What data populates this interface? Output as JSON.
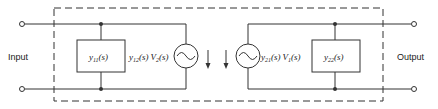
{
  "diagram": {
    "input_label": "Input",
    "output_label": "Output",
    "y11": {
      "sym": "y",
      "sub": "11",
      "arg": "(s)"
    },
    "y22": {
      "sym": "y",
      "sub": "22",
      "arg": "(s)"
    },
    "source_left": {
      "y_sym": "y",
      "y_sub": "12",
      "y_arg": "(s)",
      "v_sym": "V",
      "v_sub": "2",
      "v_arg": "(s)"
    },
    "source_right": {
      "y_sym": "y",
      "y_sub": "21",
      "y_arg": "(s)",
      "v_sym": "V",
      "v_sub": "1",
      "v_arg": "(s)"
    },
    "colors": {
      "line": "#333333",
      "background": "#ffffff"
    }
  }
}
